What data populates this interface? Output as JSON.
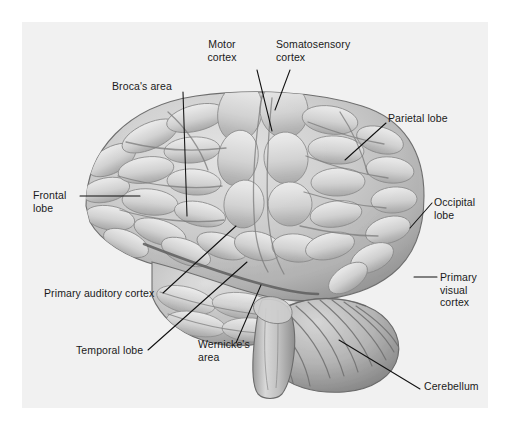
{
  "figure": {
    "width": 509,
    "height": 431,
    "background_color": "#ffffff",
    "panel_color": "#f1f1f1",
    "line_color": "#111111",
    "illustration_style": "grayscale pencil/airbrush medical illustration"
  },
  "labels": [
    {
      "id": "motor-cortex",
      "text": "Motor\ncortex",
      "x": 222,
      "y": 44,
      "align": "center",
      "anchor_x": 257,
      "anchor_y": 70,
      "tip_x": 272,
      "tip_y": 131
    },
    {
      "id": "somatosensory-cortex",
      "text": "Somatosensory\ncortex",
      "x": 276,
      "y": 44,
      "align": "left",
      "anchor_x": 290,
      "anchor_y": 70,
      "tip_x": 275,
      "tip_y": 110
    },
    {
      "id": "brocas-area",
      "text": "Broca's area",
      "x": 112,
      "y": 80,
      "align": "left",
      "anchor_x": 183,
      "anchor_y": 92,
      "tip_x": 187,
      "tip_y": 216
    },
    {
      "id": "parietal-lobe",
      "text": "Parietal lobe",
      "x": 388,
      "y": 112,
      "align": "left",
      "anchor_x": 386,
      "anchor_y": 123,
      "tip_x": 345,
      "tip_y": 160
    },
    {
      "id": "frontal-lobe",
      "text": "Frontal\nlobe",
      "x": 33,
      "y": 189,
      "align": "left",
      "anchor_x": 80,
      "anchor_y": 196,
      "tip_x": 140,
      "tip_y": 196
    },
    {
      "id": "occipital-lobe",
      "text": "Occipital\nlobe",
      "x": 434,
      "y": 196,
      "align": "left",
      "anchor_x": 432,
      "anchor_y": 203,
      "tip_x": 410,
      "tip_y": 228
    },
    {
      "id": "primary-visual-cortex",
      "text": "Primary\nvisual\ncortex",
      "x": 440,
      "y": 271,
      "align": "left",
      "anchor_x": 437,
      "anchor_y": 277,
      "tip_x": 414,
      "tip_y": 277
    },
    {
      "id": "primary-auditory-cortex",
      "text": "Primary auditory cortex",
      "x": 44,
      "y": 293,
      "align": "left",
      "anchor_x": 163,
      "anchor_y": 293,
      "tip_x": 236,
      "tip_y": 226
    },
    {
      "id": "temporal-lobe",
      "text": "Temporal lobe",
      "x": 76,
      "y": 350,
      "align": "left",
      "anchor_x": 148,
      "anchor_y": 350,
      "tip_x": 247,
      "tip_y": 262
    },
    {
      "id": "wernickes-area",
      "text": "Wernicke's\narea",
      "x": 198,
      "y": 345,
      "align": "left",
      "anchor_x": 236,
      "anchor_y": 343,
      "tip_x": 261,
      "tip_y": 285
    },
    {
      "id": "cerebellum",
      "text": "Cerebellum",
      "x": 424,
      "y": 385,
      "align": "left",
      "anchor_x": 420,
      "anchor_y": 389,
      "tip_x": 339,
      "tip_y": 340
    }
  ],
  "structures": [
    {
      "id": "cerebrum",
      "name": "cerebral cortex"
    },
    {
      "id": "cerebellum",
      "name": "cerebellum"
    },
    {
      "id": "brainstem",
      "name": "brainstem"
    }
  ]
}
